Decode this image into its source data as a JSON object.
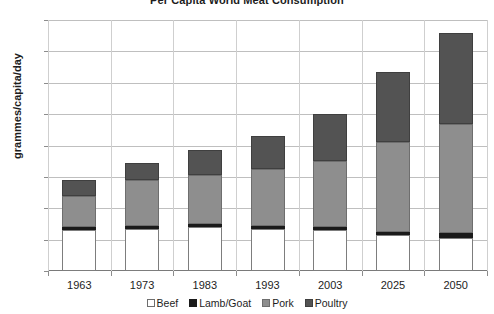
{
  "chart_data": {
    "type": "bar",
    "stacked": true,
    "title": "Per Capita World Meat Consumption",
    "xlabel": "",
    "ylabel": "grammes/capita/day",
    "ylim": [
      0,
      160
    ],
    "ytick_step": 20,
    "yticks": [
      0,
      20,
      40,
      60,
      80,
      100,
      120,
      140,
      160
    ],
    "grid": "horizontal-and-vertical",
    "legend_position": "bottom",
    "categories": [
      "1963",
      "1973",
      "1983",
      "1993",
      "2003",
      "2025",
      "2050"
    ],
    "series": [
      {
        "name": "Beef",
        "color": "#ffffff",
        "values": [
          26,
          27,
          28,
          27,
          26,
          23,
          21
        ]
      },
      {
        "name": "Lamb/Goat",
        "color": "#1a1a1a",
        "values": [
          2,
          2,
          2,
          2,
          2,
          2,
          3
        ]
      },
      {
        "name": "Pork",
        "color": "#8e8e8e",
        "values": [
          20,
          29,
          31,
          36,
          42,
          57,
          70
        ]
      },
      {
        "name": "Poultry",
        "color": "#535353",
        "values": [
          10,
          11,
          16,
          21,
          30,
          45,
          58
        ]
      }
    ],
    "totals": [
      58,
      69,
      77,
      86,
      100,
      127,
      152
    ]
  }
}
